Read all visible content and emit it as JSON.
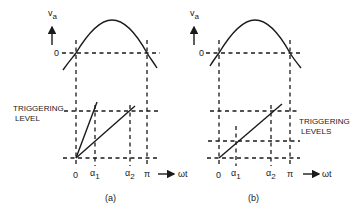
{
  "figure": {
    "panels": [
      {
        "id": "a",
        "caption": "(a)",
        "y_axis_label": "v",
        "y_axis_subscript": "a",
        "zero_label": "0",
        "trigger_label_line1": "TRIGGERING",
        "trigger_label_line2": "LEVEL",
        "x_ticks": [
          "0",
          "α",
          "α",
          "π"
        ],
        "x_tick_subscripts": [
          "",
          "1",
          "2",
          ""
        ],
        "x_axis_label": "ωt"
      },
      {
        "id": "b",
        "caption": "(b)",
        "y_axis_label": "v",
        "y_axis_subscript": "a",
        "zero_label": "0",
        "trigger_label_line1": "TRIGGERING",
        "trigger_label_line2": "LEVELS",
        "x_ticks": [
          "0",
          "α",
          "α",
          "π"
        ],
        "x_tick_subscripts": [
          "",
          "1",
          "2",
          ""
        ],
        "x_axis_label": "ωt"
      }
    ],
    "colors": {
      "ink": "#1a1a1a",
      "background": "#ffffff"
    }
  }
}
